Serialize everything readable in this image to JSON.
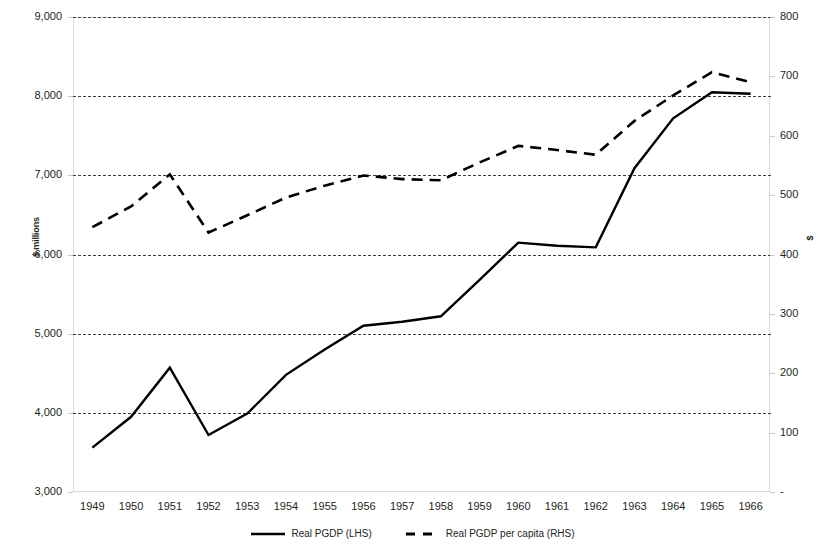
{
  "chart_data": {
    "type": "line",
    "title": "",
    "xlabel": "",
    "ylabel": "$ millions",
    "ylabel_right": "$",
    "grid": true,
    "legend_position": "bottom",
    "x": [
      1949,
      1950,
      1951,
      1952,
      1953,
      1954,
      1955,
      1956,
      1957,
      1958,
      1959,
      1960,
      1961,
      1962,
      1963,
      1964,
      1965,
      1966
    ],
    "categories": [
      "1949",
      "1950",
      "1951",
      "1952",
      "1953",
      "1954",
      "1955",
      "1956",
      "1957",
      "1958",
      "1959",
      "1960",
      "1961",
      "1962",
      "1963",
      "1964",
      "1965",
      "1966"
    ],
    "ylim": [
      3000,
      9000
    ],
    "yticks": [
      3000,
      4000,
      5000,
      6000,
      7000,
      8000,
      9000
    ],
    "ytick_labels": [
      "3,000",
      "4,000",
      "5,000",
      "6,000",
      "7,000",
      "8,000",
      "9,000"
    ],
    "ylim_right": [
      0,
      800
    ],
    "yticks_right": [
      0,
      100,
      200,
      300,
      400,
      500,
      600,
      700,
      800
    ],
    "ytick_labels_right": [
      "-",
      "100",
      "200",
      "300",
      "400",
      "500",
      "600",
      "700",
      "800"
    ],
    "series": [
      {
        "name": "Real PGDP (LHS)",
        "axis": "left",
        "style": "solid",
        "color": "#000000",
        "values": [
          3560,
          3950,
          4570,
          3720,
          3990,
          4480,
          4800,
          5100,
          5150,
          5220,
          5680,
          6150,
          6110,
          6090,
          7090,
          7720,
          8050,
          8030
        ]
      },
      {
        "name": "Real PGDP per capita (RHS)",
        "axis": "right",
        "style": "dashed",
        "color": "#000000",
        "values": [
          446,
          481,
          535,
          437,
          466,
          496,
          516,
          533,
          527,
          525,
          555,
          583,
          576,
          568,
          625,
          668,
          707,
          690
        ]
      }
    ]
  },
  "axes": {
    "left_title": "$ millions",
    "right_title": "$",
    "left_ticks": [
      "9,000",
      "8,000",
      "7,000",
      "6,000",
      "5,000",
      "4,000",
      "3,000"
    ],
    "right_ticks": [
      "800",
      "700",
      "600",
      "500",
      "400",
      "300",
      "200",
      "100",
      "-"
    ],
    "x_ticks": [
      "1949",
      "1950",
      "1951",
      "1952",
      "1953",
      "1954",
      "1955",
      "1956",
      "1957",
      "1958",
      "1959",
      "1960",
      "1961",
      "1962",
      "1963",
      "1964",
      "1965",
      "1966"
    ]
  },
  "legend": {
    "items": [
      {
        "label": "Real PGDP (LHS)",
        "style": "solid"
      },
      {
        "label": "Real PGDP per capita (RHS)",
        "style": "dashed"
      }
    ]
  }
}
